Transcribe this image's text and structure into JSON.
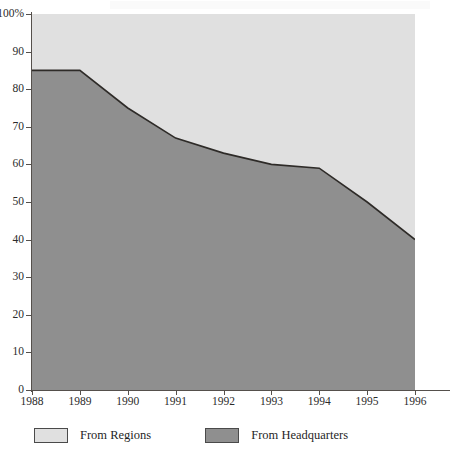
{
  "chart_data": {
    "type": "area",
    "title": "",
    "subtitle": "",
    "xlabel": "",
    "ylabel": "",
    "stacked": true,
    "stack_total": 100,
    "grid": false,
    "legend_position": "bottom",
    "x": [
      1988,
      1989,
      1990,
      1991,
      1992,
      1993,
      1994,
      1995,
      1996
    ],
    "categories": [
      "1988",
      "1989",
      "1990",
      "1991",
      "1992",
      "1993",
      "1994",
      "1995",
      "1996"
    ],
    "xlim": [
      1988,
      1996
    ],
    "ylim": [
      0,
      100
    ],
    "yticks": [
      0,
      10,
      20,
      30,
      40,
      50,
      60,
      70,
      80,
      90,
      100
    ],
    "ytick_labels": [
      "0",
      "10",
      "20",
      "30",
      "40",
      "50",
      "60",
      "70",
      "80",
      "90",
      "100%"
    ],
    "series": [
      {
        "name": "From Headquarters",
        "color": "#8f8f8f",
        "stack_order": 0,
        "values": [
          85,
          85,
          75,
          67,
          63,
          60,
          59,
          50,
          40
        ]
      },
      {
        "name": "From Regions",
        "color": "#e0e0e0",
        "stack_order": 1,
        "values": [
          15,
          15,
          25,
          33,
          37,
          40,
          41,
          50,
          60
        ]
      }
    ]
  },
  "legend": {
    "items": [
      {
        "label": "From Regions",
        "color": "#e0e0e0"
      },
      {
        "label": "From Headquarters",
        "color": "#8f8f8f"
      }
    ]
  },
  "colors": {
    "upper_series": "#e0e0e0",
    "lower_series": "#8f8f8f",
    "boundary_line": "#2e2b28",
    "axis": "#55504c",
    "text": "#1f1f1f",
    "background": "#ffffff"
  }
}
